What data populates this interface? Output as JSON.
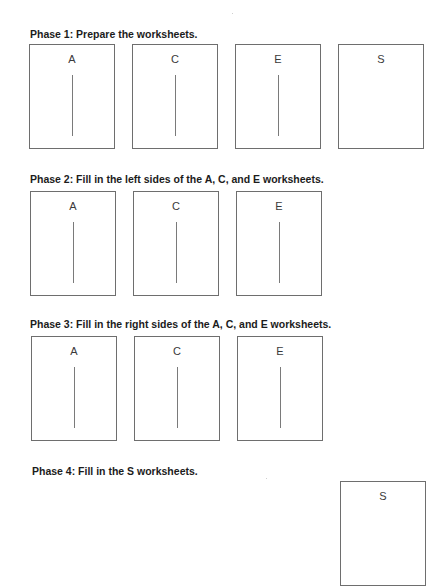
{
  "phases": [
    {
      "title": "Phase 1: Prepare the worksheets.",
      "sheets": [
        {
          "label": "A",
          "has_divider": true
        },
        {
          "label": "C",
          "has_divider": true
        },
        {
          "label": "E",
          "has_divider": true
        },
        {
          "label": "S",
          "has_divider": false
        }
      ]
    },
    {
      "title": "Phase 2: Fill in the left sides of the A, C, and E worksheets.",
      "sheets": [
        {
          "label": "A",
          "has_divider": true
        },
        {
          "label": "C",
          "has_divider": true
        },
        {
          "label": "E",
          "has_divider": true
        }
      ]
    },
    {
      "title": "Phase 3: Fill in the right sides of the A, C, and E worksheets.",
      "sheets": [
        {
          "label": "A",
          "has_divider": true
        },
        {
          "label": "C",
          "has_divider": true
        },
        {
          "label": "E",
          "has_divider": true
        }
      ]
    },
    {
      "title": "Phase 4: Fill in the S worksheets.",
      "sheets": [
        {
          "label": "S",
          "has_divider": false
        }
      ]
    }
  ]
}
